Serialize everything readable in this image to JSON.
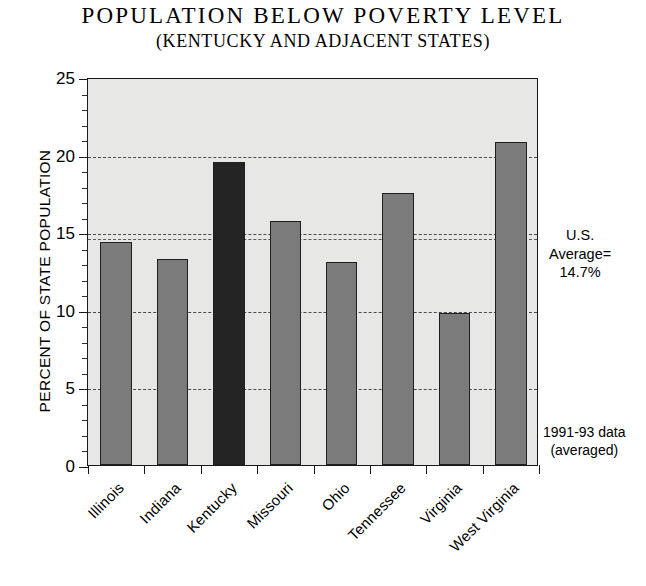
{
  "chart_data": {
    "type": "bar",
    "title": "POPULATION  BELOW  POVERTY  LEVEL",
    "subtitle": "(KENTUCKY AND ADJACENT STATES)",
    "xlabel": "",
    "ylabel": "PERCENT OF STATE POPULATION",
    "ylim": [
      0,
      25
    ],
    "ytick_values": [
      0,
      5,
      10,
      15,
      20,
      25
    ],
    "ytick_labels": [
      "0",
      "5",
      "10",
      "15",
      "20",
      "25"
    ],
    "y_minor_step": 1,
    "grid": "horizontal dashed at 5,10,15,20",
    "legend": "none",
    "categories": [
      "Illinois",
      "Indiana",
      "Kentucky",
      "Missouri",
      "Ohio",
      "Tennessee",
      "Virginia",
      "West Virginia"
    ],
    "values": [
      14.4,
      13.3,
      19.5,
      15.7,
      13.1,
      17.5,
      9.8,
      20.8
    ],
    "highlight_category": "Kentucky",
    "reference_line": {
      "label": "U.S. Average=",
      "value": 14.7,
      "value_label": "14.7%",
      "title": "U.S."
    },
    "annotations": [
      {
        "line1": "U.S.",
        "line2": "Average=",
        "line3": "14.7%"
      },
      {
        "line1": "1991-93 data",
        "line2": "(averaged)"
      }
    ],
    "colors": {
      "bar": "#7b7b7b",
      "bar_highlight": "#242424",
      "plot_background": "#e7e7e5",
      "axis": "#1a1a1a",
      "gridline": "#4a4a4a",
      "page_background": "#ffffff"
    }
  },
  "notes": {
    "average": {
      "l1": "U.S.",
      "l2": "Average=",
      "l3": "14.7%"
    },
    "source": {
      "l1": "1991-93 data",
      "l2": "(averaged)"
    }
  }
}
